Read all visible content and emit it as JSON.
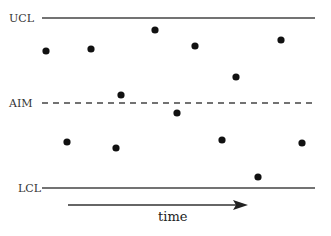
{
  "diagram": {
    "type": "control-chart",
    "labels": {
      "ucl": "UCL",
      "aim": "AIM",
      "lcl": "LCL",
      "axis": "time"
    },
    "lines": {
      "ucl": {
        "y": 18,
        "x1": 42,
        "x2": 315,
        "style": "solid"
      },
      "aim": {
        "y": 103,
        "x1": 42,
        "x2": 315,
        "style": "dashed"
      },
      "lcl": {
        "y": 188,
        "x1": 42,
        "x2": 315,
        "style": "solid"
      }
    },
    "arrow": {
      "y": 205,
      "x1": 68,
      "x2": 248
    },
    "points": [
      [
        46,
        51
      ],
      [
        67,
        142
      ],
      [
        91,
        49
      ],
      [
        116,
        148
      ],
      [
        121,
        95
      ],
      [
        155,
        30
      ],
      [
        177,
        113
      ],
      [
        195,
        46
      ],
      [
        222,
        140
      ],
      [
        236,
        77
      ],
      [
        258,
        177
      ],
      [
        281,
        40
      ],
      [
        302,
        143
      ]
    ],
    "colors": {
      "line": "#444444",
      "point": "#111111"
    }
  }
}
